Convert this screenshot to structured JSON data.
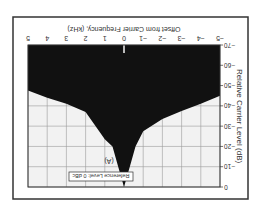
{
  "chart_data": {
    "type": "area",
    "title": "",
    "panel_label": "(A)",
    "annotation": "Reference Level: 0 dBc",
    "xlabel": "Offset from Carrier Frequency, (kHz)",
    "ylabel": "Relative Carrier Level (dB)",
    "xlim": [
      -5,
      5
    ],
    "ylim": [
      -70,
      0
    ],
    "x_ticks": [
      "-5",
      "-4",
      "-3",
      "-2",
      "-1",
      "0",
      "1",
      "2",
      "3",
      "4",
      "5"
    ],
    "y_ticks": [
      "-70",
      "-60",
      "-50",
      "-40",
      "-30",
      "-20",
      "-10",
      "0"
    ],
    "grid": true,
    "orientation_note": "figure rendered upside down (rotated 180 degrees)",
    "series": [
      {
        "name": "Phase noise spectrum envelope",
        "x": [
          -5,
          -4,
          -3,
          -2,
          -1,
          -0.6,
          -0.3,
          0,
          0.3,
          0.6,
          1,
          2,
          3,
          4,
          5
        ],
        "values": [
          -45,
          -41,
          -37.5,
          -33.5,
          -27.5,
          -20,
          -10,
          0,
          -10,
          -20,
          -23.5,
          -37,
          -41,
          -44,
          -47.5
        ]
      }
    ],
    "colors": {
      "fill": "#111111",
      "background": "#f2f2f2",
      "grid": "#9a9a9a",
      "frame": "#333333"
    }
  }
}
